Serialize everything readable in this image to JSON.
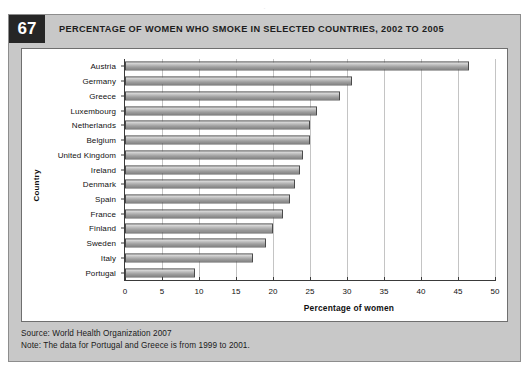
{
  "page": {
    "top_bleed_text": "."
  },
  "header": {
    "badge": "67",
    "title": "PERCENTAGE OF WOMEN WHO SMOKE IN SELECTED COUNTRIES, 2002 TO 2005"
  },
  "notes": {
    "source": "Source: World Health Organization 2007",
    "note": "Note: The data for Portugal and Greece is from 1999 to 2001."
  },
  "chart_data": {
    "type": "bar",
    "orientation": "horizontal",
    "title": "PERCENTAGE OF WOMEN WHO SMOKE IN SELECTED COUNTRIES, 2002 TO 2005",
    "xlabel": "Percentage of women",
    "ylabel": "Country",
    "xlim": [
      0,
      50
    ],
    "xticks": [
      0,
      5,
      10,
      15,
      20,
      25,
      30,
      35,
      40,
      45,
      50
    ],
    "grid": "vertical",
    "legend": "none",
    "categories": [
      "Austria",
      "Germany",
      "Greece",
      "Luxembourg",
      "Netherlands",
      "Belgium",
      "United Kingdom",
      "Ireland",
      "Denmark",
      "Spain",
      "France",
      "Finland",
      "Sweden",
      "Italy",
      "Portugal"
    ],
    "values": [
      46.5,
      30.7,
      29,
      26,
      25,
      25,
      24,
      23.7,
      23,
      22.3,
      21.3,
      20,
      19,
      17.3,
      9.5
    ]
  }
}
